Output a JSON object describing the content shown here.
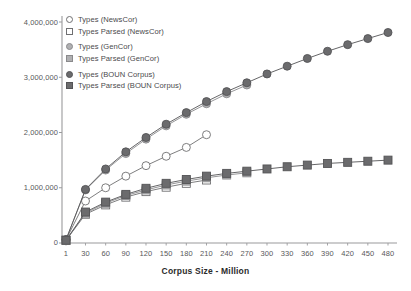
{
  "chart_data": {
    "type": "line",
    "title": "",
    "xlabel": "Corpus Size - Million",
    "ylabel": "",
    "x_ticks": [
      1,
      30,
      60,
      90,
      120,
      150,
      180,
      210,
      240,
      270,
      300,
      330,
      360,
      390,
      420,
      450,
      480
    ],
    "y_ticks": [
      0,
      1000000,
      2000000,
      3000000,
      4000000
    ],
    "y_tick_labels": [
      "0",
      "1,000,000",
      "2,000,000",
      "3,000,000",
      "4,000,000"
    ],
    "ylim": [
      0,
      4000000
    ],
    "grid": false,
    "legend_position": "upper-left",
    "series": [
      {
        "name": "Types (NewsCor)",
        "marker": "circle-open",
        "color": "#ffffff",
        "edge_color": "#6f6f71",
        "x": [
          1,
          30,
          60,
          90,
          120,
          150,
          180,
          210
        ],
        "values": [
          60000,
          760000,
          1000000,
          1210000,
          1400000,
          1570000,
          1730000,
          1960000
        ]
      },
      {
        "name": "Types Parsed (NewsCor)",
        "marker": "square-open",
        "color": "#ffffff",
        "edge_color": "#6f6f71",
        "x": [
          1,
          30,
          60,
          90,
          120,
          150,
          180,
          210
        ],
        "values": [
          50000,
          520000,
          690000,
          830000,
          930000,
          1010000,
          1080000,
          1140000
        ]
      },
      {
        "name": "Types (GenCor)",
        "marker": "circle-filled",
        "color": "#b0b0b2",
        "edge_color": "#8a8a8c",
        "x": [
          1,
          30,
          60,
          90,
          120,
          150,
          180,
          210,
          240,
          270
        ],
        "values": [
          60000,
          960000,
          1320000,
          1620000,
          1880000,
          2120000,
          2330000,
          2520000,
          2700000,
          2860000
        ]
      },
      {
        "name": "Types Parsed (GenCor)",
        "marker": "square-filled-light",
        "color": "#b0b0b2",
        "edge_color": "#8a8a8c",
        "x": [
          1,
          30,
          60,
          90,
          120,
          150,
          180,
          210,
          240,
          270
        ],
        "values": [
          50000,
          540000,
          720000,
          860000,
          960000,
          1050000,
          1120000,
          1180000,
          1230000,
          1270000
        ]
      },
      {
        "name": "Types (BOUN Corpus)",
        "marker": "circle-filled-dark",
        "color": "#6b6b6d",
        "edge_color": "#545456",
        "x": [
          1,
          30,
          60,
          90,
          120,
          150,
          180,
          210,
          240,
          270,
          300,
          330,
          360,
          390,
          420,
          450,
          480
        ],
        "values": [
          60000,
          970000,
          1340000,
          1650000,
          1910000,
          2150000,
          2360000,
          2560000,
          2740000,
          2900000,
          3060000,
          3200000,
          3340000,
          3470000,
          3590000,
          3700000,
          3810000
        ]
      },
      {
        "name": "Types Parsed (BOUN Corpus)",
        "marker": "square-filled-dark",
        "color": "#6b6b6d",
        "edge_color": "#545456",
        "x": [
          1,
          30,
          60,
          90,
          120,
          150,
          180,
          210,
          240,
          270,
          300,
          330,
          360,
          390,
          420,
          450,
          480
        ],
        "values": [
          50000,
          560000,
          740000,
          880000,
          990000,
          1080000,
          1150000,
          1210000,
          1260000,
          1300000,
          1340000,
          1380000,
          1410000,
          1440000,
          1460000,
          1480000,
          1500000
        ]
      }
    ]
  },
  "legend": {
    "items": [
      {
        "label": "Types (NewsCor)"
      },
      {
        "label": "Types Parsed (NewsCor)"
      },
      {
        "label": "Types (GenCor)"
      },
      {
        "label": "Types Parsed (GenCor)"
      },
      {
        "label": "Types (BOUN Corpus)"
      },
      {
        "label": "Types Parsed (BOUN Corpus)"
      }
    ]
  },
  "colors": {
    "open": "#ffffff",
    "mid": "#b0b0b2",
    "dark": "#6b6b6d",
    "axis": "#9a9a9c",
    "text": "#58585a"
  }
}
